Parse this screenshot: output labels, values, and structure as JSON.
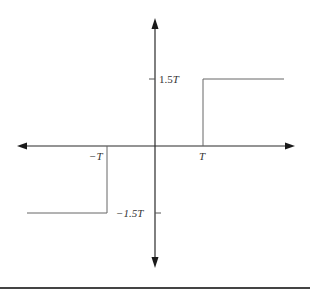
{
  "figure": {
    "type": "piecewise-step-function-plot",
    "colors": {
      "axis": "#2a2a2a",
      "curve": "#555555",
      "label": "#333333",
      "rule": "#444444"
    },
    "axes": {
      "x_axis": {
        "arrows": "both"
      },
      "y_axis": {
        "arrows": "both"
      }
    },
    "x_ticks": [
      {
        "value": "-T",
        "label_prefix": "−",
        "label_var": "T"
      },
      {
        "value": "T",
        "label_prefix": "",
        "label_var": "T"
      }
    ],
    "y_ticks": [
      {
        "value": "1.5T",
        "label_prefix": "1.5",
        "label_var": "T"
      },
      {
        "value": "-1.5T",
        "label_prefix": "−1.5",
        "label_var": "T"
      }
    ],
    "segments": [
      {
        "description": "constant at -1.5T for x < -T",
        "x_range": [
          "-inf",
          "-T"
        ],
        "y": "-1.5T"
      },
      {
        "description": "zero between -T and T",
        "x_range": [
          "-T",
          "T"
        ],
        "y": "0"
      },
      {
        "description": "constant at 1.5T for x > T",
        "x_range": [
          "T",
          "inf"
        ],
        "y": "1.5T"
      }
    ]
  },
  "labels": {
    "pos_y_prefix": "1.5",
    "pos_y_var": "T",
    "neg_y_prefix": "−1.5",
    "neg_y_var": "T",
    "neg_x_prefix": "−",
    "neg_x_var": "T",
    "pos_x_var": "T"
  }
}
